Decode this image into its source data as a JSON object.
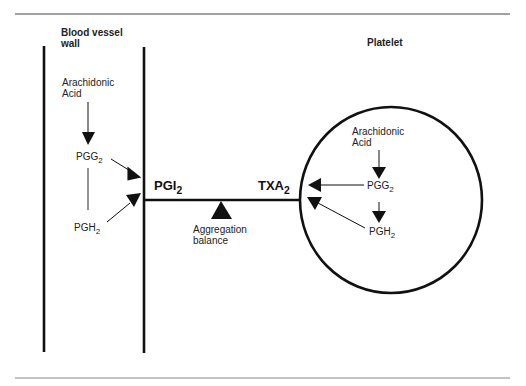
{
  "diagram": {
    "vessel_wall": {
      "title_line1": "Blood vessel",
      "title_line2": "wall",
      "precursor_line1": "Arachidonic",
      "precursor_line2": "Acid",
      "intermediate1": {
        "base": "PGG",
        "sub": "2"
      },
      "intermediate2": {
        "base": "PGH",
        "sub": "2"
      },
      "product": {
        "base": "PGI",
        "sub": "2"
      }
    },
    "platelet": {
      "title": "Platelet",
      "precursor_line1": "Arachidonic",
      "precursor_line2": "Acid",
      "intermediate1": {
        "base": "PGG",
        "sub": "2"
      },
      "intermediate2": {
        "base": "PGH",
        "sub": "2"
      },
      "product": {
        "base": "TXA",
        "sub": "2"
      }
    },
    "balance": {
      "line1": "Aggregation",
      "line2": "balance"
    },
    "colors": {
      "ink": "#111111",
      "background": "#ffffff",
      "rule": "#555555"
    }
  }
}
